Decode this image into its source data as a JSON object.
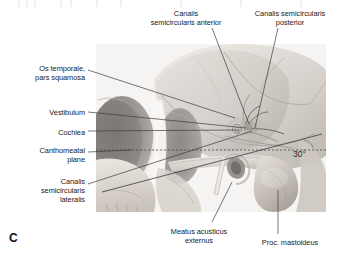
{
  "figure": {
    "letter": "C",
    "caption_letter_name": "figure-part-letter"
  },
  "annotations": {
    "angle": "30°"
  },
  "labels": [
    {
      "id": "canalis-semicircularis-anterior",
      "text": "Canalis\nsemicircularis anterior",
      "align": "center",
      "x": 134,
      "y": 9,
      "width": 104
    },
    {
      "id": "canalis-semicircularis-posterior",
      "text": "Canalis semicircularis\nposterior",
      "align": "center",
      "x": 240,
      "y": 9,
      "width": 100
    },
    {
      "id": "os-temporale-pars-squamosa",
      "text": "Os temporale,\npars squamosa",
      "align": "right",
      "x": 3,
      "y": 64,
      "width": 82
    },
    {
      "id": "vestibulum",
      "text": "Vestibulum",
      "align": "right",
      "x": 3,
      "y": 108,
      "width": 82
    },
    {
      "id": "cochlea",
      "text": "Cochlea",
      "align": "right",
      "x": 3,
      "y": 128,
      "width": 82
    },
    {
      "id": "canthomeatal-plane",
      "text": "Canthomeatal\nplane",
      "align": "right",
      "x": 3,
      "y": 146,
      "width": 82
    },
    {
      "id": "canalis-semicircularis-lateralis",
      "text": "Canalis\nsemicircularis\nlateralis",
      "align": "right",
      "x": 3,
      "y": 177,
      "width": 82
    },
    {
      "id": "meatus-acusticus-externus",
      "text": "Meatus acusticus\nexternus",
      "align": "center",
      "x": 152,
      "y": 227,
      "width": 94
    },
    {
      "id": "proc-mastoideus",
      "text": "Proc. mastoideus",
      "align": "center",
      "x": 244,
      "y": 238,
      "width": 92
    }
  ],
  "colors": {
    "leader_line": "#3c3c3c",
    "dashed_plane": "#4a4a4a",
    "background": "#ffffff",
    "text": "#1a1a1a"
  },
  "image_region": {
    "name": "skull-lateral-radiograph",
    "x": 96,
    "y": 44,
    "width": 230,
    "height": 168
  }
}
